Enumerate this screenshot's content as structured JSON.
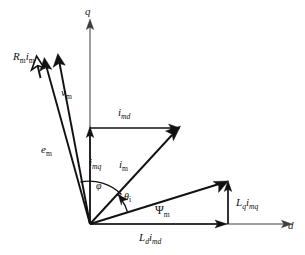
{
  "figure": {
    "type": "phasor-diagram",
    "background_color": "#ffffff",
    "line_color": "#111111",
    "axis_color": "#3c3c3c"
  },
  "axes": {
    "vertical": {
      "label": "q",
      "name": "q-axis",
      "direction": "up"
    },
    "horizontal": {
      "label": "d",
      "name": "d-axis",
      "direction": "right"
    }
  },
  "origin": {
    "x": 90,
    "y": 224
  },
  "phasors": [
    {
      "id": "Rm_im",
      "label_main": "R",
      "label_sub1": "m",
      "label_main2": "i",
      "label_sub2": "m",
      "label_text": "Rm im",
      "name": "phasor-rm-im",
      "description": "resistive voltage drop phasor, open arrowhead"
    },
    {
      "id": "vm",
      "label_main": "v",
      "label_sub1": "m",
      "label_text": "vm",
      "name": "phasor-vm",
      "description": "terminal voltage phasor"
    },
    {
      "id": "em",
      "label_main": "e",
      "label_sub1": "m",
      "label_text": "em",
      "name": "phasor-em",
      "description": "back emf phasor"
    },
    {
      "id": "imd",
      "label_main": "i",
      "label_sub1": "md",
      "label_text": "imd",
      "name": "phasor-imd",
      "description": "d-axis current component, horizontal"
    },
    {
      "id": "imq",
      "label_main": "i",
      "label_sub1": "mq",
      "label_text": "imq",
      "name": "phasor-imq",
      "description": "q-axis current component, vertical"
    },
    {
      "id": "im",
      "label_main": "i",
      "label_sub1": "m",
      "label_text": "im",
      "name": "phasor-im",
      "description": "stator current phasor"
    },
    {
      "id": "psim",
      "label_main": "Ψ",
      "label_sub1": "m",
      "label_text": "Ψm",
      "name": "phasor-psi-m",
      "description": "flux linkage phasor"
    },
    {
      "id": "Ld_imd",
      "label_main": "L",
      "label_sub1": "d",
      "label_main2": "i",
      "label_sub2": "md",
      "label_text": "Ld imd",
      "name": "phasor-ld-imd",
      "description": "d-axis flux component along d axis"
    },
    {
      "id": "Lq_imq",
      "label_main": "L",
      "label_sub1": "q",
      "label_main2": "i",
      "label_sub2": "mq",
      "label_text": "Lq imq",
      "name": "phasor-lq-imq",
      "description": "q-axis flux component, vertical"
    }
  ],
  "angles": [
    {
      "id": "phi",
      "symbol": "φ",
      "name": "angle-phi",
      "description": "angle between q-axis current component and current phasor"
    },
    {
      "id": "theta_i",
      "symbol": "θ",
      "sub": "i",
      "name": "angle-theta-i",
      "description": "current angle from flux phasor"
    }
  ]
}
